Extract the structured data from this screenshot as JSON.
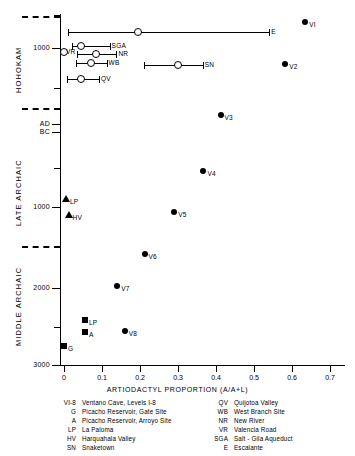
{
  "chart_data": {
    "type": "scatter",
    "title": "",
    "xlabel": "ARTIODACTYL PROPORTION (A/A+L)",
    "ylabel": "",
    "xlim": [
      0,
      0.7
    ],
    "grid": false,
    "legend_position": "below-axes",
    "x_ticks": [
      {
        "value": 0,
        "label": "0"
      },
      {
        "value": 0.1,
        "label": "0.1"
      },
      {
        "value": 0.2,
        "label": "0.2"
      },
      {
        "value": 0.3,
        "label": "0.3"
      },
      {
        "value": 0.4,
        "label": "0.4"
      },
      {
        "value": 0.5,
        "label": "0.5"
      },
      {
        "value": 0.6,
        "label": "0.6"
      },
      {
        "value": 0.7,
        "label": "0.7"
      }
    ],
    "y_ticks": [
      {
        "label": "1000",
        "px": 48
      },
      {
        "label": "AD",
        "px": 124
      },
      {
        "label": "BC",
        "px": 132
      },
      {
        "label": "1000",
        "px": 207
      },
      {
        "label": "2000",
        "px": 288
      },
      {
        "label": "3000",
        "px": 365
      }
    ],
    "y_minor_ticks_px": [
      15,
      88,
      168,
      247,
      327
    ],
    "y_era_labels": [
      {
        "name": "HOHOKAM",
        "center_px": 75
      },
      {
        "name": "LATE ARCHAIC",
        "center_px": 195
      },
      {
        "name": "MIDDLE ARCHAIC",
        "center_px": 310
      }
    ],
    "y_era_separators_px": [
      16,
      108,
      246
    ],
    "series": [
      {
        "name": "Ventana Cave levels (filled circles)",
        "marker": "filled-circle",
        "points": [
          {
            "label": "VI",
            "x": 0.635,
            "y_px": 22
          },
          {
            "label": "V2",
            "x": 0.582,
            "y_px": 64
          },
          {
            "label": "V3",
            "x": 0.412,
            "y_px": 115
          },
          {
            "label": "V4",
            "x": 0.367,
            "y_px": 171
          },
          {
            "label": "V5",
            "x": 0.29,
            "y_px": 212
          },
          {
            "label": "V6",
            "x": 0.212,
            "y_px": 254
          },
          {
            "label": "V7",
            "x": 0.14,
            "y_px": 286
          },
          {
            "label": "V8",
            "x": 0.16,
            "y_px": 331
          }
        ]
      },
      {
        "name": "Picacho Reservoir (filled squares)",
        "marker": "filled-square",
        "points": [
          {
            "label": "LP",
            "x": 0.055,
            "y_px": 320
          },
          {
            "label": "A",
            "x": 0.055,
            "y_px": 332
          },
          {
            "label": "G",
            "x": 0.0,
            "y_px": 346
          }
        ]
      },
      {
        "name": "Archaic sites (filled triangles)",
        "marker": "filled-triangle",
        "points": [
          {
            "label": "LP",
            "x": 0.005,
            "y_px": 199
          },
          {
            "label": "HV",
            "x": 0.012,
            "y_px": 215
          }
        ]
      },
      {
        "name": "Hohokam sites (open circles with range bars)",
        "marker": "open-circle-with-error-bar",
        "points": [
          {
            "label": "E",
            "x": 0.195,
            "x_low": 0.01,
            "x_high": 0.54,
            "y_px": 32
          },
          {
            "label": "SGA",
            "x": 0.045,
            "x_low": 0.022,
            "x_high": 0.12,
            "y_px": 46
          },
          {
            "label": "VR",
            "x": 0.0,
            "x_low": 0.0,
            "x_high": 0.0,
            "y_px": 52
          },
          {
            "label": "NR",
            "x": 0.085,
            "x_low": 0.035,
            "x_high": 0.138,
            "y_px": 54
          },
          {
            "label": "WB",
            "x": 0.07,
            "x_low": 0.032,
            "x_high": 0.112,
            "y_px": 63
          },
          {
            "label": "SN",
            "x": 0.3,
            "x_low": 0.21,
            "x_high": 0.365,
            "y_px": 65
          },
          {
            "label": "QV",
            "x": 0.045,
            "x_low": 0.008,
            "x_high": 0.092,
            "y_px": 79
          }
        ]
      }
    ]
  },
  "legend": {
    "left": [
      {
        "key": "VI-8",
        "text": "Ventano Cave, Levels I-8"
      },
      {
        "key": "G",
        "text": "Picacho Reservoir, Gate Site"
      },
      {
        "key": "A",
        "text": "Picacho Reservoir, Arroyo Site"
      },
      {
        "key": "LP",
        "text": "La Paloma"
      },
      {
        "key": "HV",
        "text": "Harquahala Valley"
      },
      {
        "key": "SN",
        "text": "Snaketown"
      }
    ],
    "right": [
      {
        "key": "QV",
        "text": "Quijotoa Valley"
      },
      {
        "key": "WB",
        "text": "West Branch Site"
      },
      {
        "key": "NR",
        "text": "New River"
      },
      {
        "key": "VR",
        "text": "Valencia Road"
      },
      {
        "key": "SGA",
        "text": "Salt - Gila Aqueduct"
      },
      {
        "key": "E",
        "text": "Escalante"
      }
    ]
  }
}
